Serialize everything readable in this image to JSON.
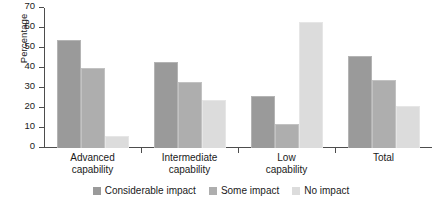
{
  "chart_data": {
    "type": "bar",
    "title": "",
    "xlabel": "",
    "ylabel": "Percentage",
    "ylim": [
      0,
      70
    ],
    "yticks": [
      0,
      10,
      20,
      30,
      40,
      50,
      60,
      70
    ],
    "grid": false,
    "legend_position": "bottom",
    "categories": [
      "Advanced\ncapability",
      "Intermediate\ncapability",
      "Low\ncapability",
      "Total"
    ],
    "category_lines": [
      [
        "Advanced",
        "capability"
      ],
      [
        "Intermediate",
        "capability"
      ],
      [
        "Low",
        "capability"
      ],
      [
        "Total",
        ""
      ]
    ],
    "series": [
      {
        "name": "Considerable impact",
        "color": "#9a9a9a",
        "values": [
          54,
          43,
          26,
          46
        ]
      },
      {
        "name": "Some impact",
        "color": "#aeaeae",
        "values": [
          40,
          33,
          12,
          34
        ]
      },
      {
        "name": "No impact",
        "color": "#dcdcdc",
        "values": [
          6,
          24,
          63,
          21
        ]
      }
    ]
  },
  "axis": {
    "y_title": "Percentage",
    "y_tick_labels": [
      "0",
      "10",
      "20",
      "30",
      "40",
      "50",
      "60",
      "70"
    ]
  },
  "legend": {
    "items": [
      {
        "label": "Considerable impact",
        "swatch": "s0"
      },
      {
        "label": "Some impact",
        "swatch": "s1"
      },
      {
        "label": "No impact",
        "swatch": "s2"
      }
    ]
  }
}
